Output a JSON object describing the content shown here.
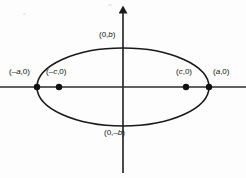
{
  "figure": {
    "background_color": "#fdfdfd",
    "stroke_color": "#1a1a1a",
    "label_color": "#111111"
  },
  "labels": {
    "vertex_left": "(–a,0)",
    "vertex_right": "(a,0)",
    "focus_left": "(–c,0)",
    "focus_right": "(c,0)",
    "covertex_top": "(0,b)",
    "covertex_bottom": "(0,–b)"
  },
  "chart_data": {
    "type": "scatter",
    "xlabel": "",
    "ylabel": "",
    "grid": false,
    "legend": null,
    "axes": {
      "origin_px": [
        123,
        87
      ],
      "x_axis": {
        "from_px": [
          0,
          87
        ],
        "to_px": [
          246,
          87
        ],
        "arrow_start": false,
        "arrow_end": false
      },
      "y_axis": {
        "from_px": [
          123,
          173
        ],
        "to_px": [
          123,
          8
        ],
        "arrow_start": false,
        "arrow_end": true
      }
    },
    "ellipse": {
      "center_px": [
        123,
        87
      ],
      "semi_major_axis_px": 86,
      "semi_minor_axis_px": 39,
      "stroke_width_px": 1.6,
      "filled": false
    },
    "points": [
      {
        "name": "vertex_left",
        "label": "(–a,0)",
        "px": [
          37,
          87
        ],
        "marker": "dot",
        "marker_radius_px": 3.2,
        "label_px": [
          9,
          72
        ]
      },
      {
        "name": "focus_left",
        "label": "(–c,0)",
        "px": [
          59,
          87
        ],
        "marker": "dot",
        "marker_radius_px": 3.2,
        "label_px": [
          46,
          72
        ]
      },
      {
        "name": "focus_right",
        "label": "(c,0)",
        "px": [
          186,
          87
        ],
        "marker": "dot",
        "marker_radius_px": 3.2,
        "label_px": [
          176,
          72
        ]
      },
      {
        "name": "vertex_right",
        "label": "(a,0)",
        "px": [
          209,
          87
        ],
        "marker": "dot",
        "marker_radius_px": 3.2,
        "label_px": [
          213,
          72
        ]
      },
      {
        "name": "covertex_top",
        "label": "(0,b)",
        "px": [
          123,
          48
        ],
        "marker": "none",
        "marker_radius_px": 0,
        "label_px": [
          99,
          34
        ]
      },
      {
        "name": "covertex_bottom",
        "label": "(0,–b)",
        "px": [
          123,
          126
        ],
        "marker": "none",
        "marker_radius_px": 0,
        "label_px": [
          104,
          130
        ]
      }
    ]
  }
}
